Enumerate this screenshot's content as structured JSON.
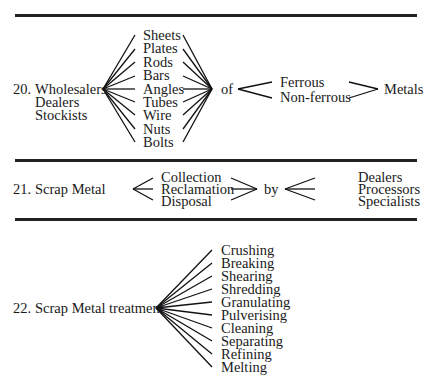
{
  "sections": [
    {
      "number": "20.",
      "subjects": [
        "Wholesalers",
        "Dealers",
        "Stockists"
      ],
      "forms": [
        "Sheets",
        "Plates",
        "Rods",
        "Bars",
        "Angles",
        "Tubes",
        "Wire",
        "Nuts",
        "Bolts"
      ],
      "connector": "of",
      "types": [
        "Ferrous",
        "Non-ferrous"
      ],
      "object": "Metals"
    },
    {
      "number": "21.",
      "subject": "Scrap Metal",
      "activities": [
        "Collection",
        "Reclamation",
        "Disposal"
      ],
      "connector": "by",
      "agents": [
        "Dealers",
        "Processors",
        "Specialists"
      ]
    },
    {
      "number": "22.",
      "subject": "Scrap Metal treatment",
      "processes": [
        "Crushing",
        "Breaking",
        "Shearing",
        "Shredding",
        "Granulating",
        "Pulverising",
        "Cleaning",
        "Separating",
        "Refining",
        "Melting"
      ]
    }
  ]
}
